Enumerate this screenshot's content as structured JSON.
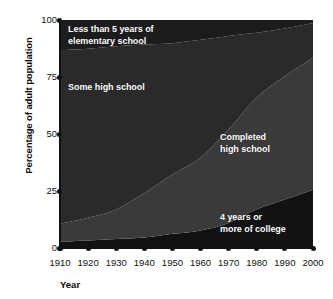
{
  "chart_data": {
    "type": "area",
    "stacked": true,
    "title": "",
    "subtitle": "",
    "xlabel": "Year",
    "ylabel": "Percentage of adult population",
    "x": [
      1910,
      1920,
      1930,
      1940,
      1950,
      1960,
      1970,
      1980,
      1990,
      2000
    ],
    "xtick_labels": [
      "1910",
      "1920",
      "1930",
      "1940",
      "1950",
      "1960",
      "1970",
      "1980",
      "1990",
      "2000"
    ],
    "ytick_labels": [
      "0",
      "25",
      "50",
      "75",
      "100"
    ],
    "yticks": [
      0,
      25,
      50,
      75,
      100
    ],
    "ylim": [
      0,
      100
    ],
    "xlim": [
      1910,
      2000
    ],
    "grid": false,
    "legend": "in-plot labels",
    "series": [
      {
        "name": "4 years or more of college",
        "label": "4 years or\nmore of college",
        "color": "#121212",
        "values": [
          2.7,
          3.3,
          3.9,
          4.6,
          6.2,
          7.7,
          11.0,
          17.0,
          21.3,
          25.6
        ]
      },
      {
        "name": "Completed high school",
        "label": "Completed\nhigh school",
        "color": "#3a3a3a",
        "values": [
          8.0,
          10.0,
          13.0,
          19.5,
          26.0,
          32.0,
          41.0,
          49.0,
          54.0,
          57.8
        ]
      },
      {
        "name": "Some high school",
        "label": "Some high school",
        "color": "#2a2a2a",
        "values": [
          76.1,
          74.1,
          71.6,
          65.1,
          57.6,
          51.6,
          41.0,
          28.4,
          21.0,
          15.3
        ]
      },
      {
        "name": "Less than 5 years of elementary school",
        "label": "Less than 5 years of\nelementary school",
        "color": "#1c1c1c",
        "values": [
          13.2,
          12.6,
          11.5,
          10.8,
          10.2,
          8.7,
          7.0,
          5.6,
          3.7,
          1.3
        ]
      }
    ]
  },
  "axis": {
    "x_title": "Year",
    "y_title": "Percentage of adult population"
  },
  "colors": {
    "background": "#ffffff",
    "axis": "#111111",
    "label_text": "#ffffff",
    "tick_text": "#111111"
  }
}
